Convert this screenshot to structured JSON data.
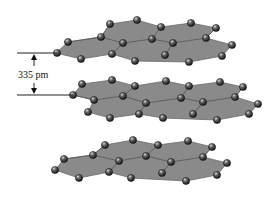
{
  "annotation": {
    "label": "335 pm",
    "meaning": "interlayer spacing"
  },
  "colors": {
    "sheet": "#8a8a8a",
    "atom": "#2a2a2a",
    "atom_highlight": "#d8d8d8",
    "line": "#222222"
  },
  "layers": [
    {
      "name": "top",
      "outline": [
        [
          56,
          53
        ],
        [
          68,
          42
        ],
        [
          101,
          37
        ],
        [
          110,
          24
        ],
        [
          137,
          20
        ],
        [
          161,
          27
        ],
        [
          191,
          23
        ],
        [
          216,
          28
        ],
        [
          206,
          38
        ],
        [
          232,
          45
        ],
        [
          222,
          56
        ],
        [
          189,
          62
        ],
        [
          135,
          61
        ],
        [
          112,
          54
        ],
        [
          81,
          59
        ]
      ],
      "bonds": [
        [
          [
            68,
            42
          ],
          [
            101,
            37
          ]
        ],
        [
          [
            101,
            37
          ],
          [
            123,
            43
          ]
        ],
        [
          [
            123,
            43
          ],
          [
            152,
            39
          ]
        ],
        [
          [
            152,
            39
          ],
          [
            173,
            43
          ]
        ],
        [
          [
            173,
            43
          ],
          [
            206,
            38
          ]
        ],
        [
          [
            101,
            37
          ],
          [
            110,
            24
          ]
        ],
        [
          [
            152,
            39
          ],
          [
            161,
            27
          ]
        ],
        [
          [
            123,
            43
          ],
          [
            112,
            54
          ]
        ],
        [
          [
            173,
            43
          ],
          [
            165,
            55
          ]
        ],
        [
          [
            206,
            38
          ],
          [
            216,
            28
          ]
        ]
      ],
      "atoms": [
        [
          57,
          53
        ],
        [
          68,
          42
        ],
        [
          81,
          59
        ],
        [
          101,
          37
        ],
        [
          110,
          24
        ],
        [
          112,
          54
        ],
        [
          123,
          43
        ],
        [
          135,
          61
        ],
        [
          137,
          20
        ],
        [
          152,
          39
        ],
        [
          161,
          27
        ],
        [
          165,
          55
        ],
        [
          173,
          43
        ],
        [
          189,
          62
        ],
        [
          191,
          23
        ],
        [
          206,
          38
        ],
        [
          216,
          28
        ],
        [
          222,
          56
        ],
        [
          232,
          45
        ]
      ]
    },
    {
      "name": "middle",
      "outline": [
        [
          73,
          95
        ],
        [
          82,
          84
        ],
        [
          112,
          80
        ],
        [
          135,
          86
        ],
        [
          166,
          81
        ],
        [
          189,
          86
        ],
        [
          220,
          82
        ],
        [
          243,
          87
        ],
        [
          235,
          97
        ],
        [
          258,
          104
        ],
        [
          249,
          114
        ],
        [
          217,
          120
        ],
        [
          163,
          118
        ],
        [
          139,
          114
        ],
        [
          110,
          118
        ],
        [
          88,
          112
        ],
        [
          94,
          100
        ]
      ],
      "bonds": [
        [
          [
            73,
            95
          ],
          [
            94,
            100
          ]
        ],
        [
          [
            94,
            100
          ],
          [
            123,
            96
          ]
        ],
        [
          [
            123,
            96
          ],
          [
            146,
            103
          ]
        ],
        [
          [
            146,
            103
          ],
          [
            181,
            98
          ]
        ],
        [
          [
            181,
            98
          ],
          [
            203,
            102
          ]
        ],
        [
          [
            203,
            102
          ],
          [
            235,
            97
          ]
        ],
        [
          [
            123,
            96
          ],
          [
            135,
            86
          ]
        ],
        [
          [
            181,
            98
          ],
          [
            189,
            86
          ]
        ],
        [
          [
            146,
            103
          ],
          [
            139,
            114
          ]
        ],
        [
          [
            203,
            102
          ],
          [
            193,
            114
          ]
        ],
        [
          [
            235,
            97
          ],
          [
            243,
            87
          ]
        ]
      ],
      "atoms": [
        [
          73,
          95
        ],
        [
          82,
          84
        ],
        [
          88,
          112
        ],
        [
          94,
          100
        ],
        [
          110,
          118
        ],
        [
          112,
          80
        ],
        [
          123,
          96
        ],
        [
          135,
          86
        ],
        [
          139,
          114
        ],
        [
          146,
          103
        ],
        [
          163,
          118
        ],
        [
          166,
          81
        ],
        [
          181,
          98
        ],
        [
          189,
          86
        ],
        [
          193,
          114
        ],
        [
          203,
          102
        ],
        [
          217,
          120
        ],
        [
          220,
          82
        ],
        [
          235,
          97
        ],
        [
          243,
          87
        ],
        [
          249,
          114
        ],
        [
          258,
          104
        ]
      ]
    },
    {
      "name": "bottom",
      "outline": [
        [
          55,
          170
        ],
        [
          64,
          159
        ],
        [
          93,
          155
        ],
        [
          105,
          145
        ],
        [
          133,
          140
        ],
        [
          158,
          145
        ],
        [
          188,
          141
        ],
        [
          212,
          147
        ],
        [
          203,
          157
        ],
        [
          227,
          163
        ],
        [
          217,
          175
        ],
        [
          186,
          181
        ],
        [
          131,
          178
        ],
        [
          109,
          172
        ],
        [
          79,
          178
        ]
      ],
      "bonds": [
        [
          [
            64,
            159
          ],
          [
            93,
            155
          ]
        ],
        [
          [
            93,
            155
          ],
          [
            119,
            161
          ]
        ],
        [
          [
            119,
            161
          ],
          [
            146,
            156
          ]
        ],
        [
          [
            146,
            156
          ],
          [
            171,
            162
          ]
        ],
        [
          [
            171,
            162
          ],
          [
            203,
            157
          ]
        ],
        [
          [
            93,
            155
          ],
          [
            105,
            145
          ]
        ],
        [
          [
            146,
            156
          ],
          [
            158,
            145
          ]
        ],
        [
          [
            119,
            161
          ],
          [
            109,
            172
          ]
        ],
        [
          [
            171,
            162
          ],
          [
            162,
            173
          ]
        ],
        [
          [
            203,
            157
          ],
          [
            212,
            147
          ]
        ]
      ],
      "atoms": [
        [
          55,
          170
        ],
        [
          64,
          159
        ],
        [
          79,
          178
        ],
        [
          93,
          155
        ],
        [
          105,
          145
        ],
        [
          109,
          172
        ],
        [
          119,
          161
        ],
        [
          131,
          178
        ],
        [
          133,
          140
        ],
        [
          146,
          156
        ],
        [
          158,
          145
        ],
        [
          162,
          173
        ],
        [
          171,
          162
        ],
        [
          186,
          181
        ],
        [
          188,
          141
        ],
        [
          203,
          157
        ],
        [
          212,
          147
        ],
        [
          217,
          175
        ],
        [
          227,
          163
        ]
      ]
    }
  ],
  "guides": {
    "top_line": {
      "x1": 17,
      "x2": 57,
      "y": 53
    },
    "bottom_line": {
      "x1": 17,
      "x2": 73,
      "y": 95
    },
    "arrow_x": 34,
    "label_pos": [
      18,
      78
    ]
  }
}
